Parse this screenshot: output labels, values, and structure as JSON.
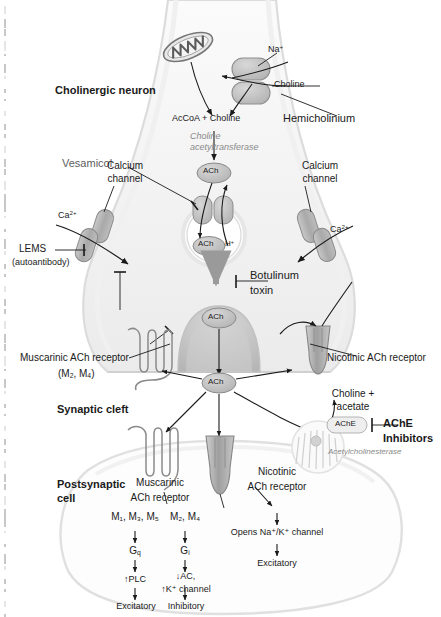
{
  "figure": {
    "colors": {
      "ink": "#1a1a1a",
      "drug_label": "#5d5d5d",
      "enzyme_label": "#8a8a8a",
      "cell_fill": "#f2f2f2",
      "cell_stroke": "#d4d4d4",
      "organelle_fill": "#b8b8b8",
      "vesicle_fill": "#e2e2e2"
    }
  },
  "presynaptic": {
    "neuron_label": "Cholinergic neuron",
    "mitochondrion": "mitochondrion",
    "na_ion": "Na",
    "na_charge": "+",
    "choline_transport": "Choline",
    "hemicholinium": "Hemicholinium",
    "substrates": "AcCoA + Choline",
    "enzyme_line1": "Choline",
    "enzyme_line2": "acetyltransferase",
    "ach_cytosol": "ACh",
    "vesamicol": "Vesamicol",
    "vesicle_ach": "ACh",
    "vesicle_proton": "H",
    "vesicle_proton_charge": "+",
    "botulinum_line1": "Botulinum",
    "botulinum_line2": "toxin"
  },
  "calcium_left": {
    "channel_line1": "Calcium",
    "channel_line2": "channel",
    "ion": "Ca",
    "ion_charge": "2+",
    "lems": "LEMS",
    "lems_sub": "(autoantibody)"
  },
  "calcium_right": {
    "channel_line1": "Calcium",
    "channel_line2": "channel",
    "ion": "Ca",
    "ion_charge": "2+"
  },
  "cleft": {
    "label": "Synaptic cleft",
    "ach_terminal": "ACh",
    "ach_cleft": "ACh",
    "autoreceptor_line1": "Muscarinic ACh receptor",
    "autoreceptor_line2_pre": "(M",
    "autoreceptor_m2": "2",
    "autoreceptor_mid": ", M",
    "autoreceptor_m4": "4",
    "autoreceptor_line2_post": ")",
    "nicotinic_autoreceptor": "Nicotinic ACh receptor",
    "degradation_line1": "Choline +",
    "degradation_line2": "acetate",
    "ache_tag": "AChE",
    "ache_inhibitors_line1": "AChE",
    "ache_inhibitors_line2": "Inhibitors",
    "ache_full_name": "Acetylcholinesterase"
  },
  "postsynaptic": {
    "cell_line1": "Postsynaptic",
    "cell_line2": "cell",
    "muscarinic_line1": "Muscarinic",
    "muscarinic_line2": "ACh receptor",
    "nicotinic_line1": "Nicotinic",
    "nicotinic_line2": "ACh receptor",
    "subtypes_gq": "M₁, M₃, M₅",
    "subtypes_gi": "M₂, M₄",
    "g_protein_q": "G",
    "g_protein_q_sub": "q",
    "g_protein_i": "G",
    "g_protein_i_sub": "i",
    "effector_q": "↑PLC",
    "effector_i_line1": "↓AC,",
    "effector_i_line2": "↑K⁺ channel",
    "outcome_q": "Excitatory",
    "outcome_i": "Inhibitory",
    "nicotinic_effect": "Opens Na⁺/K⁺ channel",
    "nicotinic_outcome": "Excitatory"
  }
}
